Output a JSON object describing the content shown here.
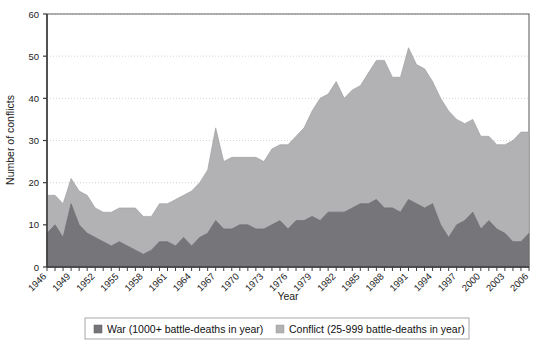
{
  "chart_data": {
    "type": "area",
    "stacked": true,
    "title": "",
    "xlabel": "Year",
    "ylabel": "Number of conflicts",
    "ylim": [
      0,
      60
    ],
    "yticks": [
      0,
      10,
      20,
      30,
      40,
      50,
      60
    ],
    "xlim": [
      1946,
      2006
    ],
    "xtick_labels": [
      "1946",
      "1949",
      "1952",
      "1955",
      "1958",
      "1961",
      "1964",
      "1967",
      "1970",
      "1973",
      "1976",
      "1979",
      "1982",
      "1985",
      "1988",
      "1991",
      "1994",
      "1997",
      "2000",
      "2003",
      "2006"
    ],
    "xtick_step": 3,
    "grid": "horizontal-dotted",
    "legend_position": "bottom",
    "colors": {
      "war": "#76767a",
      "conflict": "#b2b2b4",
      "axis": "#4a4a4a",
      "grid": "#c8c8c8",
      "background": "#ffffff"
    },
    "x": [
      1946,
      1947,
      1948,
      1949,
      1950,
      1951,
      1952,
      1953,
      1954,
      1955,
      1956,
      1957,
      1958,
      1959,
      1960,
      1961,
      1962,
      1963,
      1964,
      1965,
      1966,
      1967,
      1968,
      1969,
      1970,
      1971,
      1972,
      1973,
      1974,
      1975,
      1976,
      1977,
      1978,
      1979,
      1980,
      1981,
      1982,
      1983,
      1984,
      1985,
      1986,
      1987,
      1988,
      1989,
      1990,
      1991,
      1992,
      1993,
      1994,
      1995,
      1996,
      1997,
      1998,
      1999,
      2000,
      2001,
      2002,
      2003,
      2004,
      2005,
      2006
    ],
    "series": [
      {
        "name": "War (1000+ battle-deaths in year)",
        "legend_label": "War (1000+ battle-deaths in year)",
        "color": "#76767a",
        "values": [
          8,
          10,
          7,
          15,
          10,
          8,
          7,
          6,
          5,
          6,
          5,
          4,
          3,
          4,
          6,
          6,
          5,
          7,
          5,
          7,
          8,
          11,
          9,
          9,
          10,
          10,
          9,
          9,
          10,
          11,
          9,
          11,
          11,
          12,
          11,
          13,
          13,
          13,
          14,
          15,
          15,
          16,
          14,
          14,
          13,
          16,
          15,
          14,
          15,
          10,
          7,
          10,
          11,
          13,
          9,
          11,
          9,
          8,
          6,
          6,
          8
        ]
      },
      {
        "name": "Conflict (25-999 battle-deaths in year)",
        "legend_label": "Conflict (25-999 battle-deaths in year)",
        "color": "#b2b2b4",
        "values": [
          9,
          7,
          8,
          6,
          8,
          9,
          7,
          7,
          8,
          8,
          9,
          10,
          9,
          8,
          9,
          9,
          11,
          10,
          13,
          13,
          15,
          22,
          16,
          17,
          16,
          16,
          17,
          16,
          18,
          18,
          20,
          20,
          22,
          25,
          29,
          28,
          31,
          27,
          28,
          28,
          31,
          33,
          35,
          31,
          32,
          36,
          33,
          33,
          29,
          30,
          30,
          25,
          23,
          22,
          22,
          20,
          20,
          21,
          24,
          26,
          24
        ]
      }
    ],
    "totals": [
      17,
      17,
      15,
      21,
      18,
      17,
      14,
      13,
      13,
      14,
      14,
      14,
      12,
      12,
      15,
      15,
      16,
      17,
      18,
      20,
      23,
      33,
      25,
      26,
      26,
      26,
      26,
      25,
      28,
      29,
      29,
      31,
      33,
      37,
      40,
      41,
      44,
      40,
      42,
      43,
      46,
      49,
      49,
      45,
      45,
      52,
      48,
      47,
      44,
      40,
      37,
      35,
      34,
      35,
      31,
      31,
      29,
      29,
      30,
      32,
      32
    ]
  },
  "legend": {
    "items": [
      {
        "label": "War (1000+ battle-deaths in year)",
        "color": "#76767a"
      },
      {
        "label": "Conflict (25-999 battle-deaths in year)",
        "color": "#b2b2b4"
      }
    ]
  }
}
